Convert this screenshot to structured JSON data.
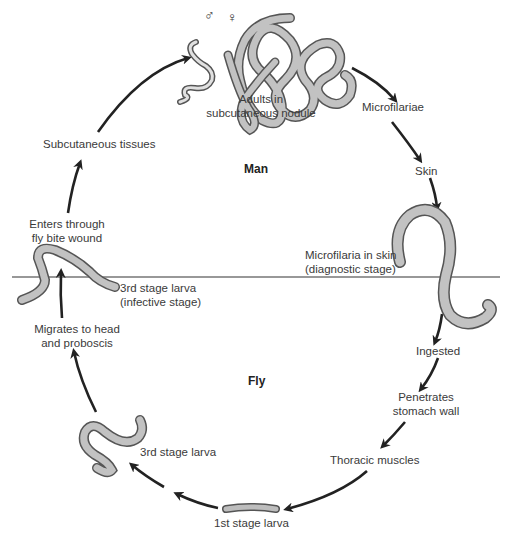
{
  "diagram": {
    "zones": {
      "upper": "Man",
      "lower": "Fly"
    },
    "symbols": {
      "male": "♂",
      "female": "♀"
    },
    "labels": {
      "adults_1": "Adults in",
      "adults_2": "subcutaneous nodule",
      "microfilariae": "Microfilariae",
      "skin": "Skin",
      "mf_skin_1": "Microfilaria in skin",
      "mf_skin_2": "(diagnostic stage)",
      "ingested": "Ingested",
      "penetrates_1": "Penetrates",
      "penetrates_2": "stomach wall",
      "thoracic": "Thoracic muscles",
      "first_larva": "1st stage larva",
      "third_larva": "3rd stage larva",
      "migrates_1": "Migrates to head",
      "migrates_2": "and proboscis",
      "l3_infective_1": "3rd stage larva",
      "l3_infective_2": "(infective stage)",
      "enters_1": "Enters through",
      "enters_2": "fly bite wound",
      "subcut": "Subcutaneous tissues"
    },
    "colors": {
      "worm_fill": "#b8b8b8",
      "worm_outline": "#555555",
      "arrow": "#222222",
      "divider": "#333333"
    }
  }
}
